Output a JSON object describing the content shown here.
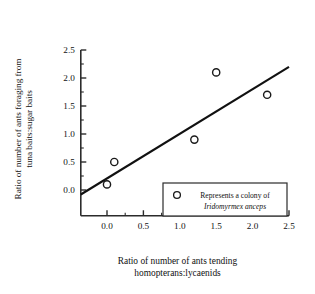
{
  "chart_data": {
    "type": "scatter",
    "title": "",
    "xlabel": "Ratio of number of ants tending\nhomopterans:lycaenids",
    "ylabel": "Ratio of number of ants foraging from\ntuna baits:sugar baits",
    "xlim": [
      -0.36,
      2.5
    ],
    "ylim": [
      -0.46,
      2.5
    ],
    "xticks": [
      "0.0",
      "0.5",
      "1.0",
      "1.5",
      "2.0",
      "2.5"
    ],
    "xtick_values": [
      0.0,
      0.5,
      1.0,
      1.5,
      2.0,
      2.5
    ],
    "yticks": [
      "0.0",
      "0.5",
      "1.0",
      "1.5",
      "2.0",
      "2.5"
    ],
    "ytick_values": [
      0.0,
      0.5,
      1.0,
      1.5,
      2.0,
      2.5
    ],
    "minor_tick_interval": 0.25,
    "grid": false,
    "legend_position": "lower-right",
    "marker": "open-circle",
    "series": [
      {
        "name": "Iridomyrmex anceps colony",
        "points": [
          {
            "x": 0.0,
            "y": 0.1
          },
          {
            "x": 0.1,
            "y": 0.5
          },
          {
            "x": 1.2,
            "y": 0.9
          },
          {
            "x": 1.5,
            "y": 2.1
          },
          {
            "x": 2.2,
            "y": 1.7
          }
        ]
      }
    ],
    "trendline": {
      "type": "linear-fit",
      "x_start": -0.36,
      "y_start": -0.08,
      "x_end": 2.5,
      "y_end": 2.2
    }
  },
  "legend": {
    "line1": "Represents a colony of",
    "line2": "Iridomyrmex anceps",
    "marker_name": "open-circle-marker"
  },
  "colors": {
    "axis": "#2b2b2b",
    "marker": "#1a1a1a",
    "trendline": "#111111",
    "background": "#ffffff"
  }
}
